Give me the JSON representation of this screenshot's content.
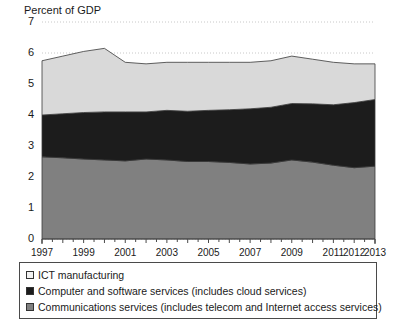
{
  "chart_data": {
    "type": "area",
    "title": "",
    "ylabel": "Percent of GDP",
    "xlabel": "",
    "ylim": [
      0,
      7
    ],
    "xlim": [
      1997,
      2013
    ],
    "grid": true,
    "stacked": true,
    "legend_position": "bottom",
    "y_ticks": [
      "0",
      "1",
      "2",
      "3",
      "4",
      "5",
      "6",
      "7"
    ],
    "x_ticks": [
      "1997",
      "1999",
      "2001",
      "2003",
      "2005",
      "2007",
      "2009",
      "2011",
      "2012",
      "2013"
    ],
    "x": [
      1997,
      1998,
      1999,
      2000,
      2001,
      2002,
      2003,
      2004,
      2005,
      2006,
      2007,
      2008,
      2009,
      2010,
      2011,
      2012,
      2013
    ],
    "series": [
      {
        "name": "Communications services (includes telecom and Internet access services)",
        "color": "#808080",
        "values": [
          2.65,
          2.62,
          2.58,
          2.55,
          2.52,
          2.58,
          2.55,
          2.5,
          2.5,
          2.47,
          2.42,
          2.45,
          2.55,
          2.48,
          2.38,
          2.3,
          2.35
        ]
      },
      {
        "name": "Computer and software services (includes cloud services)",
        "color": "#1c1c1c",
        "values": [
          1.35,
          1.42,
          1.5,
          1.55,
          1.58,
          1.52,
          1.6,
          1.62,
          1.65,
          1.7,
          1.78,
          1.8,
          1.82,
          1.88,
          1.95,
          2.1,
          2.15
        ]
      },
      {
        "name": "ICT manufacturing",
        "color": "#d9d9d9",
        "values": [
          1.75,
          1.86,
          1.97,
          2.05,
          1.6,
          1.55,
          1.55,
          1.58,
          1.55,
          1.53,
          1.5,
          1.5,
          1.53,
          1.44,
          1.37,
          1.25,
          1.15
        ]
      }
    ],
    "totals": [
      5.75,
      5.9,
      6.05,
      6.15,
      5.7,
      5.65,
      5.7,
      5.7,
      5.7,
      5.7,
      5.7,
      5.75,
      5.9,
      5.8,
      5.7,
      5.65,
      5.65
    ],
    "legend": [
      {
        "label": "ICT manufacturing",
        "color": "#f2f2f2"
      },
      {
        "label": "Computer and software services (includes cloud services)",
        "color": "#1c1c1c"
      },
      {
        "label": "Communications services (includes telecom and Internet access services)",
        "color": "#808080"
      }
    ]
  }
}
